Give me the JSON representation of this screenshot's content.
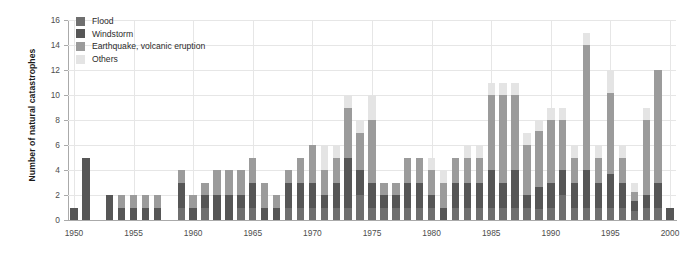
{
  "chart_data": {
    "type": "bar",
    "stacked": true,
    "title": "",
    "xlabel": "",
    "ylabel": "Number of natural catastrophes",
    "ylim": [
      0,
      16
    ],
    "ytick_step": 2,
    "yticks": [
      0,
      2,
      4,
      6,
      8,
      10,
      12,
      14,
      16
    ],
    "xlim": [
      1950,
      2000
    ],
    "xticks": [
      1950,
      1955,
      1960,
      1965,
      1970,
      1975,
      1980,
      1985,
      1990,
      1995,
      2000
    ],
    "xticklabels": [
      "1950",
      "1955",
      "1960",
      "1965",
      "1970",
      "1975",
      "1980",
      "1985",
      "1990",
      "1995",
      "2000"
    ],
    "grid": "horizontal-and-vertical",
    "legend_position": "top-left",
    "series": [
      {
        "name": "Flood",
        "color": "#6f6f6f",
        "values": [
          0,
          0,
          0,
          0,
          0,
          0,
          0,
          0,
          0,
          1,
          0,
          1,
          0,
          0,
          1,
          1,
          0,
          0,
          1,
          1,
          1,
          1,
          1,
          1,
          2,
          1,
          1,
          1,
          1,
          1,
          1,
          0,
          1,
          1,
          1,
          1,
          1,
          1,
          1,
          1,
          1,
          2,
          1,
          1,
          1,
          1,
          1,
          1,
          1,
          1,
          0
        ]
      },
      {
        "name": "Windstorm",
        "color": "#565656",
        "values": [
          1,
          5,
          0,
          2,
          1,
          1,
          1,
          1,
          0,
          2,
          1,
          1,
          2,
          2,
          1,
          2,
          1,
          1,
          2,
          2,
          2,
          1,
          2,
          4,
          2,
          2,
          1,
          1,
          2,
          2,
          1,
          1,
          2,
          2,
          2,
          3,
          2,
          3,
          1,
          2,
          2,
          2,
          2,
          3,
          2,
          3,
          2,
          1,
          1,
          2,
          1
        ]
      },
      {
        "name": "Earthquake, volcanic eruption",
        "color": "#9b9b9b",
        "values": [
          0,
          0,
          0,
          0,
          1,
          1,
          1,
          1,
          0,
          1,
          1,
          1,
          2,
          2,
          2,
          2,
          2,
          1,
          1,
          2,
          3,
          2,
          2,
          4,
          3,
          5,
          1,
          1,
          2,
          2,
          2,
          2,
          2,
          2,
          2,
          6,
          7,
          6,
          4,
          5,
          5,
          4,
          2,
          10,
          2,
          7,
          2,
          1,
          6,
          9,
          0
        ]
      },
      {
        "name": "Others",
        "color": "#e4e4e4",
        "values": [
          0,
          0,
          0,
          0,
          0,
          0,
          0,
          0,
          0,
          0,
          0,
          0,
          0,
          0,
          0,
          0,
          0,
          0,
          0,
          0,
          0,
          2,
          1,
          1,
          1,
          2,
          0,
          0,
          0,
          0,
          1,
          1,
          0,
          1,
          1,
          1,
          1,
          1,
          1,
          1,
          1,
          1,
          1,
          1,
          1,
          2,
          1,
          1,
          1,
          0,
          0
        ]
      }
    ],
    "totals": [
      1,
      5,
      0,
      2,
      2,
      2,
      2,
      2,
      0,
      4,
      2,
      3,
      4,
      4,
      4,
      5,
      3,
      2,
      4,
      5,
      6,
      6,
      6,
      10,
      8,
      10,
      3,
      3,
      5,
      5,
      5,
      4,
      5,
      6,
      6,
      11,
      11,
      11,
      7,
      8,
      9,
      9,
      6,
      15,
      6,
      12,
      6,
      3,
      9,
      12,
      1
    ]
  },
  "legend": {
    "items": [
      {
        "label": "Flood",
        "color": "#6f6f6f"
      },
      {
        "label": "Windstorm",
        "color": "#565656"
      },
      {
        "label": "Earthquake, volcanic eruption",
        "color": "#9b9b9b"
      },
      {
        "label": "Others",
        "color": "#e4e4e4"
      }
    ]
  }
}
